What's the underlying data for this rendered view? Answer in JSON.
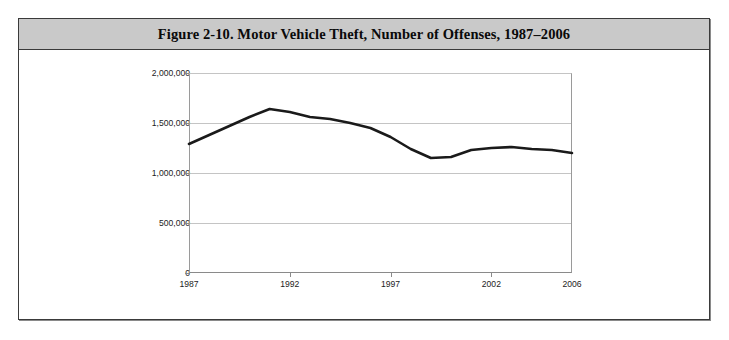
{
  "figure": {
    "title": "Figure 2-10. Motor Vehicle Theft, Number of Offenses, 1987–2006",
    "banner_color": "#c9c9c9",
    "border_color": "#3a3a3a",
    "background_color": "#ffffff"
  },
  "chart_data": {
    "type": "line",
    "title": "Figure 2-10. Motor Vehicle Theft, Number of Offenses, 1987–2006",
    "xlabel": "",
    "ylabel": "",
    "xlim": [
      1987,
      2006
    ],
    "ylim": [
      0,
      2000000
    ],
    "grid": true,
    "legend": false,
    "line_color": "#1a1a1a",
    "line_width": 2.6,
    "x": [
      1987,
      1988,
      1989,
      1990,
      1991,
      1992,
      1993,
      1994,
      1995,
      1996,
      1997,
      1998,
      1999,
      2000,
      2001,
      2002,
      2003,
      2004,
      2005,
      2006
    ],
    "values": [
      1290000,
      1380000,
      1470000,
      1560000,
      1640000,
      1610000,
      1560000,
      1540000,
      1500000,
      1450000,
      1360000,
      1240000,
      1150000,
      1160000,
      1230000,
      1250000,
      1260000,
      1240000,
      1230000,
      1200000
    ],
    "categories": [
      "1987",
      "1988",
      "1989",
      "1990",
      "1991",
      "1992",
      "1993",
      "1994",
      "1995",
      "1996",
      "1997",
      "1998",
      "1999",
      "2000",
      "2001",
      "2002",
      "2003",
      "2004",
      "2005",
      "2006"
    ],
    "x_tick_labels": [
      "1987",
      "1992",
      "1997",
      "2002",
      "2006"
    ],
    "x_tick_values": [
      1987,
      1992,
      1997,
      2002,
      2006
    ],
    "y_tick_labels": [
      "0",
      "500,000",
      "1,000,000",
      "1,500,000",
      "2,000,000"
    ],
    "y_tick_values": [
      0,
      500000,
      1000000,
      1500000,
      2000000
    ]
  }
}
